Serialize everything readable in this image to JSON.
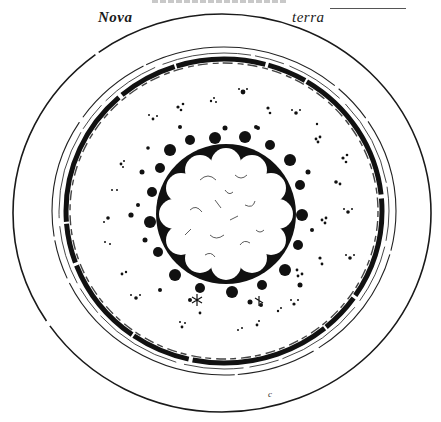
{
  "figure": {
    "header_text_cut": "",
    "labels": {
      "left": "Nova",
      "right": "terra"
    },
    "colors": {
      "ink": "#111111",
      "paper": "#ffffff"
    },
    "geometry": {
      "outer_circle": {
        "cx": 222,
        "cy": 213,
        "rx": 209,
        "ry": 199
      },
      "second_ring": {
        "cx": 224,
        "cy": 211,
        "rx": 172,
        "ry": 165
      },
      "third_ring": {
        "cx": 224,
        "cy": 211,
        "rx": 165,
        "ry": 158
      },
      "dark_band": {
        "cx": 224,
        "cy": 211,
        "rx": 158,
        "ry": 152
      },
      "center_flower": {
        "cx": 226,
        "cy": 214,
        "r": 56,
        "lobes": 12
      },
      "center_dark_halo": {
        "cx": 226,
        "cy": 214,
        "r": 72
      }
    },
    "bottom_mark": "c"
  }
}
